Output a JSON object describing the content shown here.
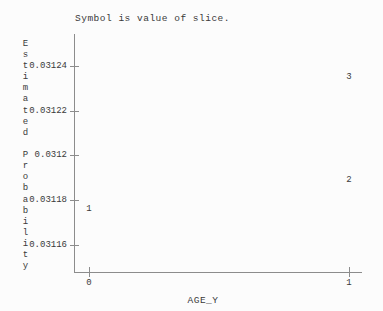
{
  "title": "Symbol is value of slice.",
  "y_axis": {
    "label": "Estimated Probability",
    "label_lines": [
      "E",
      "s",
      "t",
      "i",
      "m",
      "a",
      "t",
      "e",
      "d",
      "",
      "P",
      "r",
      "o",
      "b",
      "a",
      "b",
      "i",
      "l",
      "i",
      "t",
      "y"
    ]
  },
  "x_axis": {
    "label": "AGE_Y"
  },
  "chart_data": {
    "type": "scatter",
    "title": "Symbol is value of slice.",
    "xlabel": "AGE_Y",
    "ylabel": "Estimated Probability",
    "symbol_meaning": "value of slice",
    "x_ticks": [
      {
        "label": "0",
        "value": 0
      },
      {
        "label": "1",
        "value": 1
      }
    ],
    "y_ticks": [
      {
        "label": "0.03124",
        "value": 0.03124
      },
      {
        "label": "0.03122",
        "value": 0.03122
      },
      {
        "label": "0.0312",
        "value": 0.0312
      },
      {
        "label": "0.03118",
        "value": 0.03118
      },
      {
        "label": "0.03116",
        "value": 0.03116
      }
    ],
    "ylim": [
      0.031145,
      0.031255
    ],
    "xlim": [
      0,
      1
    ],
    "grid": false,
    "legend": "none",
    "points": [
      {
        "symbol": "1",
        "x": 0,
        "y": 0.031176
      },
      {
        "symbol": "2",
        "x": 1,
        "y": 0.031189
      },
      {
        "symbol": "3",
        "x": 1,
        "y": 0.031235
      }
    ]
  },
  "colors": {
    "text": "#3a3a3a",
    "axis": "#8c8c8c",
    "background": "#fcfcfc"
  }
}
